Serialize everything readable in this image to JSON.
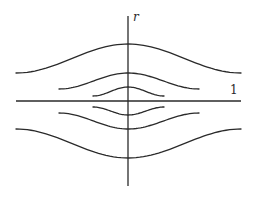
{
  "diagram": {
    "labels": {
      "vertical_axis": "r",
      "horizontal_line": "1"
    },
    "colors": {
      "stroke": "#2a2a2a",
      "background": "#ffffff"
    },
    "axes": {
      "vertical": {
        "x": 128,
        "y1": 16,
        "y2": 186
      },
      "horizontal": {
        "y": 101,
        "x1": 16,
        "x2": 241
      }
    },
    "curves": [
      {
        "id": "upper-outer",
        "x1": 16,
        "x2": 241,
        "end_y": 73,
        "apex_y": 44
      },
      {
        "id": "upper-middle",
        "x1": 59,
        "x2": 199,
        "end_y": 89,
        "apex_y": 73
      },
      {
        "id": "upper-inner",
        "x1": 93,
        "x2": 164,
        "end_y": 96,
        "apex_y": 87
      },
      {
        "id": "lower-inner",
        "x1": 93,
        "x2": 164,
        "end_y": 107,
        "apex_y": 115
      },
      {
        "id": "lower-middle",
        "x1": 59,
        "x2": 199,
        "end_y": 113,
        "apex_y": 129
      },
      {
        "id": "lower-outer",
        "x1": 16,
        "x2": 241,
        "end_y": 129,
        "apex_y": 158
      }
    ]
  }
}
